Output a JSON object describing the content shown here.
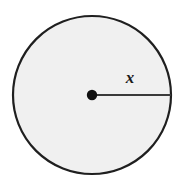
{
  "figure": {
    "kind": "geometry-diagram",
    "background_color": "#ffffff",
    "circle": {
      "name": "circle-shape",
      "center_x": 92,
      "center_y": 95,
      "radius": 80,
      "fill_color": "#f0f0f0",
      "stroke_color": "#1f1f1f",
      "stroke_width": 2.2
    },
    "center_point": {
      "name": "center-dot",
      "x": 92,
      "y": 95,
      "radius": 5,
      "color": "#101010"
    },
    "radius_segment": {
      "name": "radius-line",
      "x1": 92,
      "y1": 95,
      "x2": 172,
      "y2": 95,
      "color": "#3a3a3a",
      "stroke_width": 1.8
    },
    "labels": {
      "radius_label": "x"
    }
  }
}
